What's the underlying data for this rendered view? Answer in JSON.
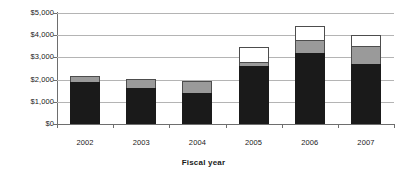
{
  "chart_data": {
    "type": "bar",
    "subtype": "stacked-column",
    "title": "",
    "xlabel": "Fiscal year",
    "ylabel": "",
    "categories": [
      "2002",
      "2003",
      "2004",
      "2005",
      "2006",
      "2007"
    ],
    "ylim": [
      0,
      5000
    ],
    "ytick_values": [
      0,
      1000,
      2000,
      3000,
      4000,
      5000
    ],
    "ytick_labels": [
      "$0",
      "$1,000",
      "$2,000",
      "$3,000",
      "$4,000",
      "$5,000"
    ],
    "grid": true,
    "legend": "none",
    "series": [
      {
        "name": "series-1-black",
        "color": "#1a1a1a",
        "values": [
          1900,
          1620,
          1400,
          2600,
          3200,
          2700
        ]
      },
      {
        "name": "series-2-gray",
        "color": "#9a9a9a",
        "values": [
          250,
          430,
          520,
          200,
          600,
          800
        ]
      },
      {
        "name": "series-3-white",
        "color": "#ffffff",
        "values": [
          0,
          0,
          0,
          650,
          600,
          530
        ]
      }
    ],
    "totals": [
      2150,
      2050,
      1920,
      3450,
      4400,
      4030
    ]
  },
  "colors": {
    "series_black": "#1a1a1a",
    "series_gray": "#9a9a9a",
    "series_white": "#ffffff",
    "gridline": "#b4b4b4",
    "axis": "#6e6e6e",
    "background": "#ffffff",
    "text": "#1a1a1a"
  }
}
